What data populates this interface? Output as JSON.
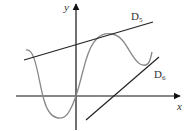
{
  "diagram": {
    "axes": {
      "x_label": "x",
      "y_label": "y"
    },
    "lines": [
      {
        "name": "D",
        "subscript": "5",
        "description": "tangent line at local maximum"
      },
      {
        "name": "D",
        "subscript": "6",
        "description": "tangent line at local minimum"
      }
    ],
    "colors": {
      "axes": "#111111",
      "lines": "#222222",
      "curve": "#888888"
    }
  }
}
